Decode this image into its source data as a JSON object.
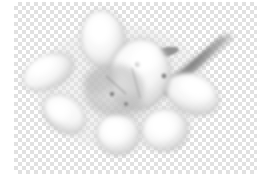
{
  "viewport": {
    "name": "image-canvas-viewport",
    "background_color": "#ffffff",
    "width": 271,
    "height": 188
  },
  "canvas": {
    "name": "transparency-canvas",
    "x": 14,
    "y": 2,
    "width": 243,
    "height": 172,
    "checker": {
      "light_color": "#ffffff",
      "dark_color": "#e1e1e1",
      "cell_size_px": 4
    }
  },
  "artwork": {
    "title": "Grayscale plumeria flower cluster on transparent background",
    "alt_text": "Soft white flower petals with gray outlines and a diagonal stem",
    "palette": {
      "petal_light": "#fdfdfd",
      "petal_shadow": "#cfcfcf",
      "petal_outline": "#9a9a9a",
      "stem": "#8c8c8c",
      "center_dark": "#7d7d7d"
    },
    "elements": [
      {
        "name": "petal-top-center",
        "shape": "oval",
        "cx": 89,
        "cy": 36,
        "rx": 22,
        "ry": 28,
        "rotation": -8
      },
      {
        "name": "petal-left-upper",
        "shape": "oval",
        "cx": 31,
        "cy": 72,
        "rx": 26,
        "ry": 17,
        "rotation": -28
      },
      {
        "name": "petal-left-lower",
        "shape": "oval",
        "cx": 49,
        "cy": 112,
        "rx": 22,
        "ry": 17,
        "rotation": 38
      },
      {
        "name": "petal-bottom-left",
        "shape": "oval",
        "cx": 106,
        "cy": 132,
        "rx": 21,
        "ry": 20,
        "rotation": 10
      },
      {
        "name": "petal-bottom-right",
        "shape": "oval",
        "cx": 152,
        "cy": 128,
        "rx": 22,
        "ry": 21,
        "rotation": -8
      },
      {
        "name": "petal-right",
        "shape": "oval",
        "cx": 180,
        "cy": 90,
        "rx": 27,
        "ry": 19,
        "rotation": 22
      },
      {
        "name": "petal-center-large",
        "shape": "oval",
        "cx": 126,
        "cy": 72,
        "rx": 30,
        "ry": 34,
        "rotation": 6
      },
      {
        "name": "flower-core",
        "shape": "oval",
        "cx": 100,
        "cy": 88,
        "rx": 30,
        "ry": 26,
        "rotation": 0
      },
      {
        "name": "stem-diagonal",
        "shape": "tapered-line",
        "x1": 152,
        "y1": 82,
        "x2": 218,
        "y2": 34
      },
      {
        "name": "leaf-bud-small",
        "shape": "blob",
        "cx": 160,
        "cy": 52,
        "rx": 12,
        "ry": 5
      }
    ]
  }
}
